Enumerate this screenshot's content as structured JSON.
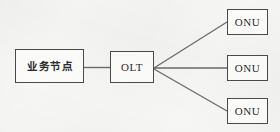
{
  "diagram": {
    "type": "network-topology",
    "title": "",
    "background_color": "#f6f6f5",
    "line_color": "#55555a",
    "border_color": "#4a4a4a",
    "text_color": "#2b2b2b",
    "nodes": [
      {
        "id": "service-node",
        "label": "业务节点",
        "script": "cjk"
      },
      {
        "id": "olt",
        "label": "OLT",
        "script": "latin"
      },
      {
        "id": "onu-1",
        "label": "ONU",
        "script": "latin"
      },
      {
        "id": "onu-2",
        "label": "ONU",
        "script": "latin"
      },
      {
        "id": "onu-3",
        "label": "ONU",
        "script": "latin"
      }
    ],
    "links": [
      {
        "from": "service-node",
        "to": "olt",
        "style": "horizontal"
      },
      {
        "from": "olt",
        "to": "onu-1",
        "style": "diagonal-up"
      },
      {
        "from": "olt",
        "to": "onu-2",
        "style": "horizontal"
      },
      {
        "from": "olt",
        "to": "onu-3",
        "style": "diagonal-down"
      }
    ]
  }
}
